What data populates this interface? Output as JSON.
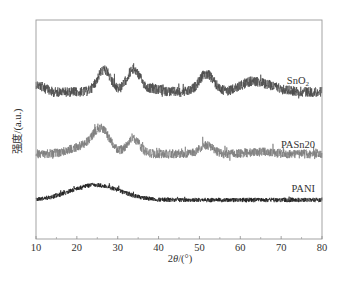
{
  "chart_data": {
    "type": "line",
    "title": "",
    "xlabel": "2θ/(°)",
    "xlabel_parts": {
      "prefix": "2",
      "symbol": "θ",
      "suffix": "/(°)"
    },
    "ylabel": "强度/(a.u.)",
    "xlim": [
      10,
      80
    ],
    "xticks": [
      10,
      20,
      30,
      40,
      50,
      60,
      70,
      80
    ],
    "xticks_minor": [
      15,
      25,
      35,
      45,
      55,
      65,
      75
    ],
    "yticks": [],
    "grid": false,
    "legend_position": "inline-right",
    "series": [
      {
        "name": "SnO2",
        "label": "SnO",
        "label_sub": "2",
        "color": "#4a4a4a",
        "baseline_y": 92,
        "noise": 5,
        "start_rise": 8,
        "peaks": [
          {
            "x": 26.6,
            "height": 22,
            "width": 1.6
          },
          {
            "x": 33.8,
            "height": 22,
            "width": 1.6
          },
          {
            "x": 51.7,
            "height": 18,
            "width": 1.8
          },
          {
            "x": 38.0,
            "height": 3,
            "width": 2.5
          },
          {
            "x": 65.0,
            "height": 8,
            "width": 4.0
          },
          {
            "x": 62.0,
            "height": 4,
            "width": 2.0
          }
        ]
      },
      {
        "name": "PASn20",
        "label": "PASn20",
        "label_sub": "",
        "color": "#7d7d7d",
        "baseline_y": 154,
        "noise": 4.5,
        "start_rise": 0,
        "peaks": [
          {
            "x": 26.0,
            "height": 22,
            "width": 2.0
          },
          {
            "x": 22.0,
            "height": 8,
            "width": 3.5
          },
          {
            "x": 33.8,
            "height": 15,
            "width": 1.6
          },
          {
            "x": 51.7,
            "height": 9,
            "width": 1.6
          },
          {
            "x": 65.0,
            "height": 2,
            "width": 3.0
          }
        ]
      },
      {
        "name": "PANI",
        "label": "PANI",
        "label_sub": "",
        "color": "#1e1e1e",
        "baseline_y": 200,
        "noise": 2.2,
        "start_rise": 0,
        "peaks": [
          {
            "x": 24.5,
            "height": 15,
            "width": 6.0
          }
        ]
      }
    ]
  },
  "plot_area": {
    "left": 36,
    "top": 20,
    "right": 322,
    "bottom": 239
  },
  "label_positions": {
    "SnO2": {
      "x": 309,
      "y": 84
    },
    "PASn20": {
      "x": 315,
      "y": 148
    },
    "PANI": {
      "x": 315,
      "y": 192
    }
  }
}
